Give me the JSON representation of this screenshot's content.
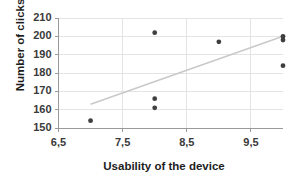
{
  "chart_data": {
    "type": "scatter",
    "title": "",
    "xlabel": "Usability of the device",
    "ylabel": "Number of clicks",
    "xlim": [
      6.5,
      10.0
    ],
    "ylim": [
      150,
      210
    ],
    "grid": true,
    "legend": null,
    "x_tick_labels": [
      "6,5",
      "7,5",
      "8,5",
      "9,5"
    ],
    "x_tick_values": [
      6.5,
      7.5,
      8.5,
      9.5
    ],
    "y_tick_labels": [
      "150",
      "160",
      "170",
      "180",
      "190",
      "200",
      "210"
    ],
    "y_tick_values": [
      150,
      160,
      170,
      180,
      190,
      200,
      210
    ],
    "series": [
      {
        "name": "observations",
        "marker": "circle",
        "color": "#3f3f3f",
        "points": [
          {
            "x": 7.0,
            "y": 154
          },
          {
            "x": 8.0,
            "y": 202
          },
          {
            "x": 8.0,
            "y": 166
          },
          {
            "x": 8.0,
            "y": 161
          },
          {
            "x": 9.0,
            "y": 197
          },
          {
            "x": 10.0,
            "y": 200
          },
          {
            "x": 10.0,
            "y": 198
          },
          {
            "x": 10.0,
            "y": 184
          }
        ]
      }
    ],
    "trendline": {
      "name": "linear-fit",
      "color": "#c9c9c9",
      "x_start": 7.0,
      "y_start": 163,
      "x_end": 10.0,
      "y_end": 200
    }
  },
  "axes": {
    "y_title": "Number of clicks",
    "x_title": "Usability of the device"
  },
  "colors": {
    "marker": "#3f3f3f",
    "trendline": "#c9c9c9",
    "gridline": "#e4e4e4",
    "axis": "#9a9a9a",
    "tick_text": "#3a3a3a",
    "title_text": "#1d1d1d",
    "background": "#ffffff"
  }
}
